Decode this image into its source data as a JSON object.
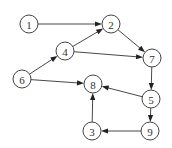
{
  "diagram": {
    "type": "directed-graph",
    "nodes": [
      {
        "id": "1",
        "label": "1"
      },
      {
        "id": "2",
        "label": "2"
      },
      {
        "id": "3",
        "label": "3"
      },
      {
        "id": "4",
        "label": "4"
      },
      {
        "id": "5",
        "label": "5"
      },
      {
        "id": "6",
        "label": "6"
      },
      {
        "id": "7",
        "label": "7"
      },
      {
        "id": "8",
        "label": "8"
      },
      {
        "id": "9",
        "label": "9"
      }
    ],
    "edges": [
      {
        "from": "1",
        "to": "2"
      },
      {
        "from": "4",
        "to": "2"
      },
      {
        "from": "4",
        "to": "7"
      },
      {
        "from": "2",
        "to": "7"
      },
      {
        "from": "6",
        "to": "4"
      },
      {
        "from": "6",
        "to": "8"
      },
      {
        "from": "7",
        "to": "5"
      },
      {
        "from": "5",
        "to": "8"
      },
      {
        "from": "5",
        "to": "9"
      },
      {
        "from": "9",
        "to": "3"
      },
      {
        "from": "3",
        "to": "8"
      }
    ]
  }
}
